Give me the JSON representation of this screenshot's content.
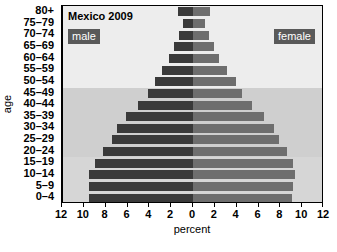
{
  "chart_data": {
    "type": "bar",
    "subtype": "population-pyramid",
    "title": "Mexico 2009",
    "xlabel": "percent",
    "ylabel": "age",
    "xlim": [
      -12,
      12
    ],
    "xticks": [
      12,
      10,
      8,
      6,
      4,
      2,
      0,
      2,
      4,
      6,
      8,
      10,
      12
    ],
    "grid": false,
    "legend_position": "inside-top-left-and-top-right",
    "categories": [
      "0–4",
      "5–9",
      "10–14",
      "15–19",
      "20–24",
      "25–29",
      "30–34",
      "35–39",
      "40–44",
      "45–49",
      "50–54",
      "55–59",
      "60–64",
      "65–69",
      "70–74",
      "75–79",
      "80+"
    ],
    "series": [
      {
        "name": "male",
        "color": "#3a3a3a",
        "side": "left",
        "values": [
          9.5,
          9.5,
          9.5,
          9.0,
          8.2,
          7.4,
          7.0,
          6.1,
          5.0,
          4.1,
          3.5,
          2.8,
          2.2,
          1.7,
          1.3,
          0.9,
          1.4
        ]
      },
      {
        "name": "female",
        "color": "#6e6e6e",
        "side": "right",
        "values": [
          9.1,
          9.2,
          9.3,
          9.2,
          8.6,
          7.9,
          7.4,
          6.5,
          5.4,
          4.5,
          3.9,
          3.1,
          2.4,
          1.9,
          1.5,
          1.1,
          1.6
        ]
      }
    ],
    "background_bands": [
      {
        "from_category": "0–4",
        "to_category": "15–19",
        "color": "#d6d6d6"
      },
      {
        "from_category": "20–24",
        "to_category": "45–49",
        "color": "#cfcfcf"
      },
      {
        "from_category": "50–54",
        "to_category": "80+",
        "color": "#ededed"
      }
    ]
  },
  "legend": {
    "male_label": "male",
    "female_label": "female"
  }
}
